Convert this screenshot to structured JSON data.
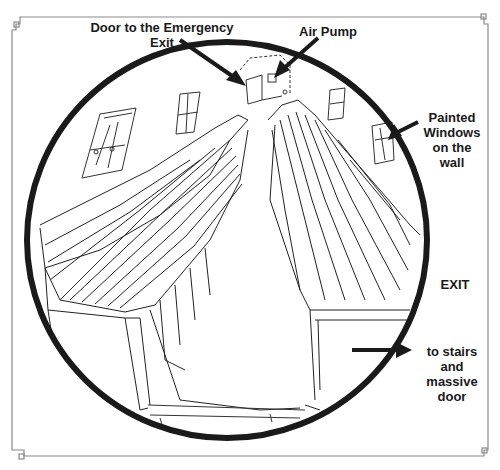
{
  "diagram": {
    "type": "hand-drawn interior sketch (circular view of a chamber with two long benches)",
    "colors": {
      "ink": "#1a1a1a",
      "frame": "#8a8a8a",
      "background": "#ffffff"
    },
    "labels": {
      "door": "Door to the Emergency\nExit",
      "air_pump": "Air Pump",
      "windows": "Painted\nWindows\non the\nwall",
      "exit": "EXIT",
      "stairs": "to stairs\nand\nmassive\ndoor"
    },
    "arrows": [
      {
        "from": "Door to the Emergency Exit",
        "to": "door at back of chamber"
      },
      {
        "from": "Air Pump",
        "to": "small box on back wall"
      },
      {
        "from": "Painted Windows on the wall",
        "to": "window on right wall"
      },
      {
        "from": "EXIT",
        "to": "to stairs and massive door",
        "direction": "right"
      }
    ],
    "elements": [
      "circular outline",
      "left bench",
      "right bench",
      "back door",
      "air pump box",
      "painted windows (4)",
      "floor edge",
      "decorative frame with corner knots"
    ]
  }
}
